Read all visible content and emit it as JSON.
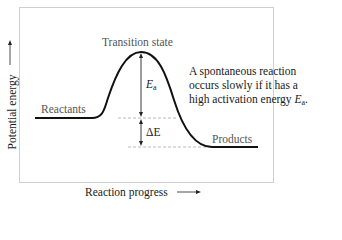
{
  "diagram": {
    "labels": {
      "transition_state": "Transition state",
      "reactants": "Reactants",
      "products": "Products",
      "activation_energy_symbol": "E",
      "activation_energy_subscript": "a",
      "delta_e": "ΔE"
    },
    "note": {
      "line1": "A spontaneous reaction",
      "line2": "occurs slowly if it has a",
      "line3_prefix": "high activation energy ",
      "line3_symbol": "E",
      "line3_subscript": "a",
      "line3_suffix": "."
    },
    "axes": {
      "x_label": "Reaction progress",
      "y_label": "Potential energy"
    },
    "colors": {
      "curve": "#111111",
      "frame": "#cfcfcf",
      "dashed": "#a0a0a0",
      "label_gray": "#555555"
    }
  }
}
